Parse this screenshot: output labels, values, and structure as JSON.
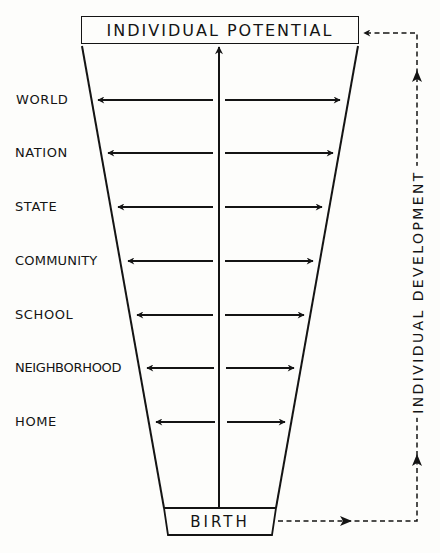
{
  "diagram": {
    "top_box": {
      "label": "INDIVIDUAL POTENTIAL"
    },
    "bottom_box": {
      "label": "BIRTH"
    },
    "side_label": "INDIVIDUAL DEVELOPMENT",
    "center_arrow": {
      "from": "BIRTH",
      "to": "INDIVIDUAL POTENTIAL",
      "direction": "up"
    },
    "levels": [
      {
        "label": "WORLD",
        "y": 100
      },
      {
        "label": "NATION",
        "y": 153
      },
      {
        "label": "STATE",
        "y": 207
      },
      {
        "label": "COMMUNITY",
        "y": 261
      },
      {
        "label": "SCHOOL",
        "y": 315
      },
      {
        "label": "NEIGHBORHOOD",
        "y": 368
      },
      {
        "label": "HOME",
        "y": 422
      }
    ],
    "feedback_path": {
      "from": "BIRTH",
      "to": "INDIVIDUAL POTENTIAL",
      "style": "dashed"
    },
    "colors": {
      "ink": "#141414",
      "paper": "#fdfdfb"
    }
  }
}
